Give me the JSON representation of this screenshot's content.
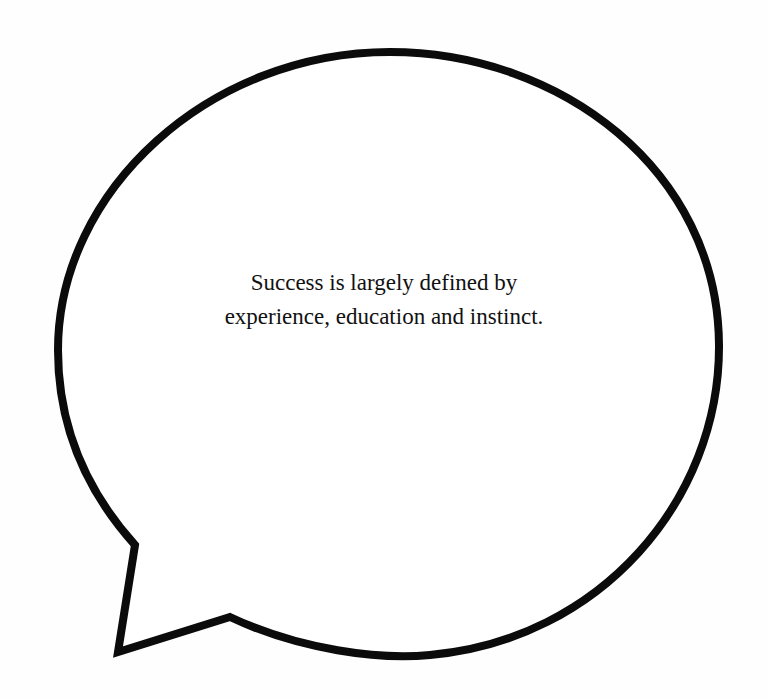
{
  "speech_bubble": {
    "text_lines": [
      "Success is largely defined by",
      "experience, education and instinct."
    ],
    "stroke_color": "#0b0b0b",
    "fill_color": "#ffffff",
    "tail_direction": "bottom-left"
  }
}
